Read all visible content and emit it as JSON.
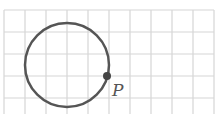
{
  "diagram": {
    "grid": {
      "columns": 10,
      "rows": 5,
      "cell_size": 21,
      "line_color": "#d4d4d4"
    },
    "circle": {
      "center_x": 67,
      "center_y": 65,
      "radius": 42,
      "stroke_color": "#555555"
    },
    "point": {
      "label": "P",
      "x": 107,
      "y": 77,
      "color": "#444444"
    }
  }
}
